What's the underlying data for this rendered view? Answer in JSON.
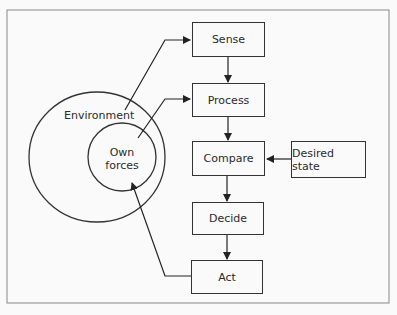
{
  "diagram": {
    "type": "feedback-control-loop",
    "nodes": [
      {
        "id": "sense",
        "label": "Sense"
      },
      {
        "id": "process",
        "label": "Process"
      },
      {
        "id": "compare",
        "label": "Compare"
      },
      {
        "id": "decide",
        "label": "Decide"
      },
      {
        "id": "act",
        "label": "Act"
      },
      {
        "id": "desired",
        "label": "Desired state"
      }
    ],
    "circles": {
      "environment": "Environment",
      "own_forces_line1": "Own",
      "own_forces_line2": "forces"
    },
    "edges": [
      {
        "from": "environment",
        "to": "sense"
      },
      {
        "from": "own_forces",
        "to": "process"
      },
      {
        "from": "sense",
        "to": "process"
      },
      {
        "from": "process",
        "to": "compare"
      },
      {
        "from": "desired",
        "to": "compare"
      },
      {
        "from": "compare",
        "to": "decide"
      },
      {
        "from": "decide",
        "to": "act"
      },
      {
        "from": "act",
        "to": "own_forces"
      }
    ]
  }
}
